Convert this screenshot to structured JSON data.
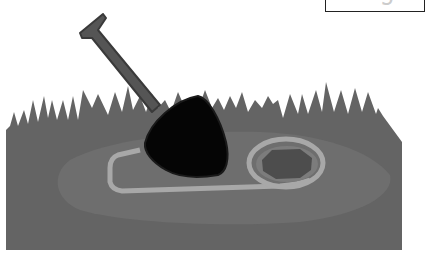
{
  "label": {
    "text_main": "di",
    "text_faded": "g"
  },
  "scene": {
    "description": "Shovel digging a hole in grass",
    "elements": [
      "grass",
      "dirt-patch",
      "dig-outline",
      "hole",
      "shovel"
    ]
  },
  "colors": {
    "grass": "#646464",
    "dirt": "#6e6e6e",
    "outline": "#a8a8a8",
    "hole_rim": "#7c7c7c",
    "hole": "#4d4d4d",
    "shovel_handle": "#555555",
    "shovel_blade": "#050505"
  }
}
